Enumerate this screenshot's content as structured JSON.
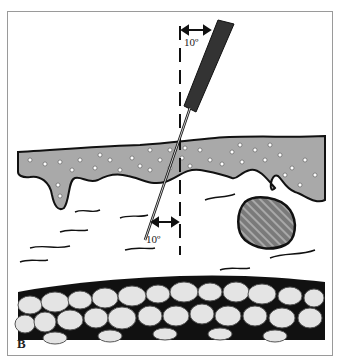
{
  "figure": {
    "panel_label": "B",
    "annotations": {
      "angle_top": "10º",
      "angle_bottom": "10º"
    },
    "layers": [
      "epidermis-with-granules",
      "dermis-with-fibers",
      "nodule",
      "subcutaneous-fat-cells"
    ],
    "colors": {
      "epidermis": "#a9a9a9",
      "needle_hub": "#333333",
      "nodule": "#7a7a7a",
      "fat_cell": "#e4e4e4",
      "fat_background": "#111111",
      "outline": "#111111"
    }
  }
}
